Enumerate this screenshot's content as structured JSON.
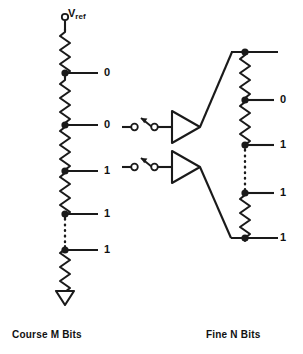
{
  "figure": {
    "stroke_color": "#1a1a1a",
    "background_color": "#ffffff"
  },
  "supply": {
    "label_text": "V",
    "label_sub": "ref"
  },
  "coarse_ladder": {
    "caption": "Course M Bits",
    "taps": [
      {
        "value": "0"
      },
      {
        "value": "0"
      },
      {
        "value": "1"
      },
      {
        "value": "1"
      },
      {
        "value": "1"
      }
    ],
    "ground_symbol": "ground-arrow"
  },
  "switches": [
    {
      "name": "switch-upper",
      "state": "open"
    },
    {
      "name": "switch-lower",
      "state": "open"
    }
  ],
  "amplifiers": [
    {
      "name": "buffer-upper",
      "symbol": "triangle"
    },
    {
      "name": "buffer-lower",
      "symbol": "triangle"
    }
  ],
  "fine_ladder": {
    "caption": "Fine N Bits",
    "taps": [
      {
        "value": "0"
      },
      {
        "value": "1"
      },
      {
        "value": "1"
      },
      {
        "value": "1"
      }
    ]
  }
}
